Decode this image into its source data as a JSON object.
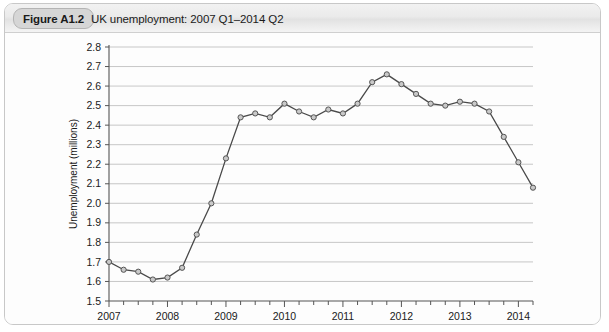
{
  "figure": {
    "badge": "Figure A1.2",
    "title": "UK unemployment: 2007 Q1–2014 Q2"
  },
  "chart_data": {
    "type": "line",
    "title": "UK unemployment: 2007 Q1–2014 Q2",
    "xlabel": "",
    "ylabel": "Unemployment (millions)",
    "ylim": [
      1.5,
      2.8
    ],
    "ytick_labels": [
      "1.5",
      "1.6",
      "1.7",
      "1.8",
      "1.9",
      "2.0",
      "2.1",
      "2.2",
      "2.3",
      "2.4",
      "2.5",
      "2.6",
      "2.7",
      "2.8"
    ],
    "ytick_values": [
      1.5,
      1.6,
      1.7,
      1.8,
      1.9,
      2.0,
      2.1,
      2.2,
      2.3,
      2.4,
      2.5,
      2.6,
      2.7,
      2.8
    ],
    "xlim": [
      2007.0,
      2014.25
    ],
    "xtick_labels": [
      "2007",
      "2008",
      "2009",
      "2010",
      "2011",
      "2012",
      "2013",
      "2014"
    ],
    "xtick_values": [
      2007,
      2008,
      2009,
      2010,
      2011,
      2012,
      2013,
      2014
    ],
    "minor_ticks_per_year": 4,
    "grid": "horizontal",
    "legend": "none",
    "line_color": "#4a4a4a",
    "marker_fill": "#c9c9c9",
    "marker_edge": "#555555",
    "x": [
      2007.0,
      2007.25,
      2007.5,
      2007.75,
      2008.0,
      2008.25,
      2008.5,
      2008.75,
      2009.0,
      2009.25,
      2009.5,
      2009.75,
      2010.0,
      2010.25,
      2010.5,
      2010.75,
      2011.0,
      2011.25,
      2011.5,
      2011.75,
      2012.0,
      2012.25,
      2012.5,
      2012.75,
      2013.0,
      2013.25,
      2013.5,
      2013.75,
      2014.0,
      2014.25
    ],
    "x_labels": [
      "2007 Q1",
      "2007 Q2",
      "2007 Q3",
      "2007 Q4",
      "2008 Q1",
      "2008 Q2",
      "2008 Q3",
      "2008 Q4",
      "2009 Q1",
      "2009 Q2",
      "2009 Q3",
      "2009 Q4",
      "2010 Q1",
      "2010 Q2",
      "2010 Q3",
      "2010 Q4",
      "2011 Q1",
      "2011 Q2",
      "2011 Q3",
      "2011 Q4",
      "2012 Q1",
      "2012 Q2",
      "2012 Q3",
      "2012 Q4",
      "2013 Q1",
      "2013 Q2",
      "2013 Q3",
      "2013 Q4",
      "2014 Q1",
      "2014 Q2"
    ],
    "values": [
      1.7,
      1.66,
      1.65,
      1.61,
      1.62,
      1.67,
      1.84,
      2.0,
      2.23,
      2.44,
      2.46,
      2.44,
      2.51,
      2.47,
      2.44,
      2.48,
      2.46,
      2.51,
      2.62,
      2.66,
      2.61,
      2.56,
      2.51,
      2.5,
      2.52,
      2.51,
      2.47,
      2.34,
      2.21,
      2.08
    ]
  }
}
